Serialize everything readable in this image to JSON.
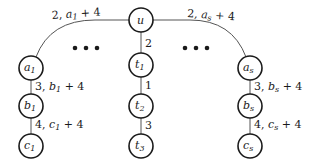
{
  "diagram": {
    "type": "tree",
    "nodes": {
      "u": {
        "label": "u",
        "sub": ""
      },
      "t1": {
        "label": "t",
        "sub": "1"
      },
      "t2": {
        "label": "t",
        "sub": "2"
      },
      "t3": {
        "label": "t",
        "sub": "3"
      },
      "a1": {
        "label": "a",
        "sub": "1"
      },
      "b1": {
        "label": "b",
        "sub": "1"
      },
      "c1": {
        "label": "c",
        "sub": "1"
      },
      "as": {
        "label": "a",
        "sub": "s"
      },
      "bs": {
        "label": "b",
        "sub": "s"
      },
      "cs": {
        "label": "c",
        "sub": "s"
      }
    },
    "edges": {
      "u_a1": {
        "num": "2, ",
        "var": "a",
        "sub": "1",
        "tail": " + 4"
      },
      "u_as": {
        "num": "2, ",
        "var": "a",
        "sub": "s",
        "tail": " + 4"
      },
      "a1_b1": {
        "num": "3, ",
        "var": "b",
        "sub": "1",
        "tail": " + 4"
      },
      "b1_c1": {
        "num": "4, ",
        "var": "c",
        "sub": "1",
        "tail": " + 4"
      },
      "as_bs": {
        "num": "3, ",
        "var": "b",
        "sub": "s",
        "tail": " + 4"
      },
      "bs_cs": {
        "num": "4, ",
        "var": "c",
        "sub": "s",
        "tail": " + 4"
      },
      "u_t1": {
        "num": "2"
      },
      "t1_t2": {
        "num": "1"
      },
      "t2_t3": {
        "num": "3"
      }
    },
    "ellipsis": "..."
  }
}
